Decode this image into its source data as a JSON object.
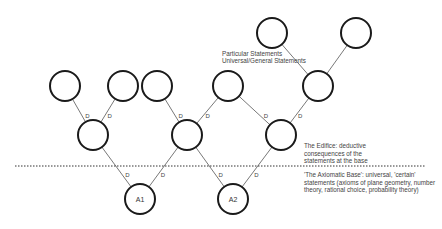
{
  "diagram": {
    "nodes": [
      {
        "id": "T1",
        "x": 272,
        "y": 33,
        "label": ""
      },
      {
        "id": "T2",
        "x": 356,
        "y": 33,
        "label": ""
      },
      {
        "id": "C1",
        "x": 65,
        "y": 86,
        "label": ""
      },
      {
        "id": "C2",
        "x": 123,
        "y": 86,
        "label": ""
      },
      {
        "id": "C3",
        "x": 157,
        "y": 86,
        "label": ""
      },
      {
        "id": "C4",
        "x": 228,
        "y": 86,
        "label": ""
      },
      {
        "id": "C5",
        "x": 318,
        "y": 86,
        "label": ""
      },
      {
        "id": "M1",
        "x": 93,
        "y": 135,
        "label": ""
      },
      {
        "id": "M2",
        "x": 187,
        "y": 135,
        "label": ""
      },
      {
        "id": "M3",
        "x": 281,
        "y": 135,
        "label": ""
      },
      {
        "id": "A1",
        "x": 140,
        "y": 199,
        "label": "A1"
      },
      {
        "id": "A2",
        "x": 233,
        "y": 199,
        "label": "A2"
      }
    ],
    "edges": [
      {
        "from": "C1",
        "to": "M1",
        "label": "D"
      },
      {
        "from": "C2",
        "to": "M1",
        "label": "D"
      },
      {
        "from": "C3",
        "to": "M2",
        "label": "D"
      },
      {
        "from": "C4",
        "to": "M2",
        "label": "D"
      },
      {
        "from": "C4",
        "to": "M3",
        "label": "D"
      },
      {
        "from": "C5",
        "to": "M3",
        "label": "D"
      },
      {
        "from": "T1",
        "to": "C5",
        "label": ""
      },
      {
        "from": "T2",
        "to": "C5",
        "label": ""
      },
      {
        "from": "M1",
        "to": "A1",
        "label": "D"
      },
      {
        "from": "M2",
        "to": "A1",
        "label": "D"
      },
      {
        "from": "M2",
        "to": "A2",
        "label": "D"
      },
      {
        "from": "M3",
        "to": "A2",
        "label": "D"
      }
    ],
    "node_radius": 15
  },
  "annotations": {
    "particular": "Particular Statements",
    "universal": "Universal/General Statements",
    "edifice": [
      "The Edifice: deductive",
      "consequences of the",
      "statements at the base"
    ],
    "axiomatic": [
      "'The Axiomatic Base': universal, 'certain'",
      "statements (axioms of plane geometry, number",
      "theory, rational choice, probability theory)"
    ]
  }
}
